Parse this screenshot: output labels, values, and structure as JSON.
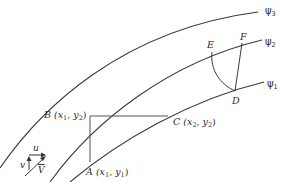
{
  "diagram": {
    "streamlines": [
      {
        "name": "psi3",
        "label": "ψ",
        "subscript": "3"
      },
      {
        "name": "psi2",
        "label": "ψ",
        "subscript": "2"
      },
      {
        "name": "psi1",
        "label": "ψ",
        "subscript": "1"
      }
    ],
    "points": {
      "A": {
        "letter": "A",
        "coords": "(x",
        "sub1": "1",
        "mid": ", y",
        "sub2": "1",
        "end": ")"
      },
      "B": {
        "letter": "B",
        "coords": "(x",
        "sub1": "1",
        "mid": ", y",
        "sub2": "2",
        "end": ")"
      },
      "C": {
        "letter": "C",
        "coords": "(x",
        "sub1": "2",
        "mid": ", y",
        "sub2": "2",
        "end": ")"
      },
      "D": {
        "letter": "D"
      },
      "E": {
        "letter": "E"
      },
      "F": {
        "letter": "F"
      }
    },
    "velocity": {
      "u": "u",
      "v": "v",
      "V": "V"
    },
    "colors": {
      "line": "#3a3a3a",
      "text": "#2b2b2b",
      "background": "#ffffff"
    }
  }
}
